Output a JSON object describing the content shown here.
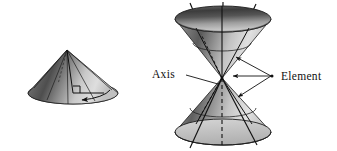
{
  "figure": {
    "background_color": "#ffffff",
    "ink_color": "#111111",
    "labels": {
      "axis": "Axis",
      "element": "Element"
    },
    "left_cone": {
      "name": "single-cone",
      "apex": {
        "x": 67,
        "y": 50
      },
      "base_center": {
        "x": 73,
        "y": 93
      },
      "base_rx": 45,
      "base_ry": 11,
      "shading": {
        "light": "#e8e8e8",
        "mid": "#b6b6b6",
        "dark": "#4a4a4a"
      },
      "rotation_arrow": "curved sweep arrow across base showing generatrix revolution",
      "right_angle_marker": true,
      "element_lines": 6
    },
    "double_cone": {
      "name": "double-cone",
      "vertex": {
        "x": 222,
        "y": 78
      },
      "top_rim_center": {
        "x": 223,
        "y": 19
      },
      "top_rim_rx": 48,
      "top_rim_ry": 13,
      "bottom_rim_center": {
        "x": 223,
        "y": 132
      },
      "bottom_rim_rx": 48,
      "bottom_rim_ry": 13,
      "axis_style": "dashed vertical line through vertex",
      "shading": {
        "light": "#ececec",
        "mid": "#b8b8b8",
        "dark": "#3f3f3f"
      },
      "extended_element_lines": 4,
      "element_arrow_count": 3,
      "element_arrow_origin": {
        "x": 272,
        "y": 76
      },
      "axis_leader_start": {
        "x": 186,
        "y": 74
      },
      "axis_leader_end": {
        "x": 219,
        "y": 83
      }
    }
  }
}
